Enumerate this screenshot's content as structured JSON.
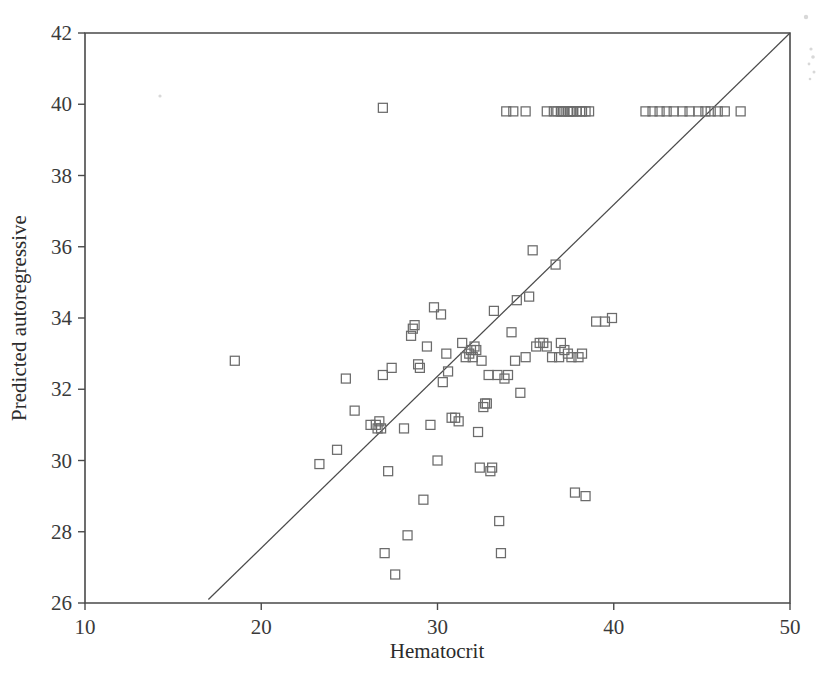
{
  "chart_data": {
    "type": "scatter",
    "title": "",
    "xlabel": "Hematocrit",
    "ylabel": "Predicted autoregressive",
    "xlim": [
      10,
      50
    ],
    "ylim": [
      26,
      42
    ],
    "xticks": [
      10,
      20,
      30,
      40,
      50
    ],
    "yticks": [
      26,
      28,
      30,
      32,
      34,
      36,
      38,
      40,
      42
    ],
    "xtick_labels": [
      "10",
      "20",
      "30",
      "40",
      "50"
    ],
    "ytick_labels": [
      "26",
      "28",
      "30",
      "32",
      "34",
      "36",
      "38",
      "40",
      "42"
    ],
    "grid": false,
    "legend": "none",
    "marker": "open-square",
    "marker_color": "#6b6b6b",
    "marker_size_px": 9,
    "reference_line": {
      "label": "identity line",
      "x": [
        17.0,
        50.0
      ],
      "y": [
        26.1,
        42.0
      ],
      "color": "#4a4a4a"
    },
    "x": [
      18.5,
      23.3,
      24.3,
      24.8,
      25.3,
      26.2,
      26.5,
      26.6,
      26.7,
      26.8,
      26.9,
      27.0,
      27.2,
      27.4,
      27.6,
      28.1,
      28.3,
      28.5,
      28.6,
      28.7,
      28.9,
      29.0,
      29.2,
      29.4,
      29.6,
      29.8,
      30.0,
      30.2,
      30.3,
      30.5,
      30.6,
      30.8,
      31.0,
      31.2,
      31.4,
      31.6,
      31.8,
      31.9,
      32.0,
      32.1,
      32.2,
      32.3,
      32.4,
      32.5,
      32.6,
      32.7,
      32.8,
      32.9,
      33.0,
      33.1,
      33.2,
      33.4,
      33.5,
      33.6,
      33.8,
      34.0,
      34.2,
      34.4,
      34.5,
      34.7,
      35.0,
      35.2,
      35.4,
      35.6,
      35.8,
      36.0,
      36.2,
      36.5,
      36.7,
      36.9,
      37.0,
      37.2,
      37.4,
      37.6,
      37.8,
      38.0,
      38.2,
      38.4,
      39.0,
      39.5,
      39.9,
      26.9,
      33.9,
      34.3,
      35.0,
      36.2,
      36.6,
      36.8,
      37.0,
      37.1,
      37.2,
      37.4,
      37.5,
      37.6,
      37.7,
      37.9,
      38.1,
      38.2,
      38.4,
      38.6,
      41.8,
      42.2,
      42.6,
      43.0,
      43.4,
      43.9,
      44.3,
      44.8,
      45.2,
      45.5,
      45.9,
      46.3,
      47.2
    ],
    "y": [
      32.8,
      29.9,
      30.3,
      32.3,
      31.4,
      31.0,
      31.0,
      30.9,
      31.1,
      30.9,
      32.4,
      27.4,
      29.7,
      32.6,
      26.8,
      30.9,
      27.9,
      33.5,
      33.7,
      33.8,
      32.7,
      32.6,
      28.9,
      33.2,
      31.0,
      34.3,
      30.0,
      34.1,
      32.2,
      33.0,
      32.5,
      31.2,
      31.2,
      31.1,
      33.3,
      32.9,
      33.0,
      33.1,
      32.9,
      33.2,
      33.1,
      30.8,
      29.8,
      32.8,
      31.5,
      31.6,
      31.6,
      32.4,
      29.7,
      29.8,
      34.2,
      32.4,
      28.3,
      27.4,
      32.3,
      32.4,
      33.6,
      32.8,
      34.5,
      31.9,
      32.9,
      34.6,
      35.9,
      33.2,
      33.3,
      33.3,
      33.2,
      32.9,
      35.5,
      32.9,
      33.3,
      33.1,
      33.0,
      32.9,
      29.1,
      32.9,
      33.0,
      29.0,
      33.9,
      33.9,
      34.0,
      39.9,
      39.8,
      39.8,
      39.8,
      39.8,
      39.8,
      39.8,
      39.8,
      39.8,
      39.8,
      39.8,
      39.8,
      39.8,
      39.8,
      39.8,
      39.8,
      39.8,
      39.8,
      39.8,
      39.8,
      39.8,
      39.8,
      39.8,
      39.8,
      39.8,
      39.8,
      39.8,
      39.8,
      39.8,
      39.8,
      39.8,
      39.8
    ],
    "n_points": 113
  },
  "axes": {
    "x_title": "Hematocrit",
    "y_title": "Predicted autoregressive"
  }
}
